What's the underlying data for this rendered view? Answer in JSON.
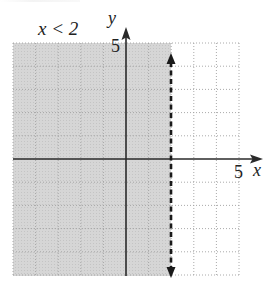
{
  "chart_data": {
    "type": "inequality-graph",
    "title": "x < 2",
    "xlabel": "x",
    "ylabel": "y",
    "xlim": [
      -5,
      5
    ],
    "ylim": [
      -5,
      5
    ],
    "grid": true,
    "grid_style": "dotted",
    "x_tick_labels": [
      {
        "value": 5,
        "label": "5"
      }
    ],
    "y_tick_labels": [
      {
        "value": 5,
        "label": "5"
      }
    ],
    "boundary": {
      "equation": "x = 2",
      "style": "dashed",
      "inclusive": false,
      "arrows": "both"
    },
    "shaded_region": {
      "condition": "x < 2",
      "color": "#d4d4d4"
    },
    "colors": {
      "shade": "#d4d4d4",
      "axis": "#2a2a2a",
      "grid": "#a8a8a8",
      "boundary": "#1a1a1a"
    }
  },
  "labels": {
    "inequality": "x < 2",
    "x_axis": "x",
    "y_axis": "y",
    "x_tick": "5",
    "y_tick": "5"
  }
}
